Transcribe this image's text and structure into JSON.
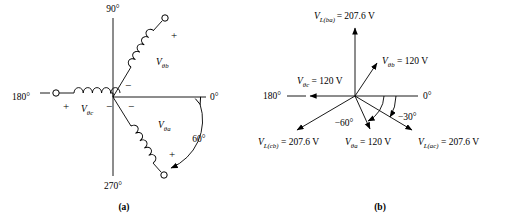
{
  "figure": {
    "panels": [
      {
        "caption": "(a)",
        "type": "source-winding-diagram",
        "axis_labels": {
          "top": "90°",
          "right": "0°",
          "bottom": "270°",
          "left": "180°"
        },
        "windings": [
          {
            "name": "phase-b-winding",
            "label_main": "V",
            "label_sub": "θb",
            "polarity_near_origin": "−",
            "polarity_far": "+",
            "orientation": "upper-right-60deg"
          },
          {
            "name": "phase-c-winding",
            "label_main": "V",
            "label_sub": "θc",
            "polarity_near_origin": "−",
            "polarity_far": "+",
            "orientation": "left-180deg"
          },
          {
            "name": "phase-a-winding",
            "label_main": "V",
            "label_sub": "θa",
            "polarity_near_origin": "−",
            "polarity_far": "+",
            "orientation": "lower-right-minus60deg"
          }
        ],
        "arc_annotation": "60°"
      },
      {
        "caption": "(b)",
        "type": "phasor-diagram",
        "axis_labels": {
          "right": "0°",
          "left": "180°"
        },
        "angle_annotations": [
          "−30°",
          "−60°"
        ],
        "phasors": [
          {
            "name": "V-L-ba",
            "symbol": "V",
            "subscript": "L(ba)",
            "value": "207.6 V",
            "equals": "=",
            "angle_deg": 90,
            "magnitude": 207.6,
            "text": "V_L(ba) = 207.6 V"
          },
          {
            "name": "V-theta-b",
            "symbol": "V",
            "subscript": "θb",
            "value": "120 V",
            "equals": "=",
            "angle_deg": 60,
            "magnitude": 120,
            "text": "V_θb = 120 V"
          },
          {
            "name": "V-theta-c",
            "symbol": "V",
            "subscript": "θc",
            "value": "120 V",
            "equals": "=",
            "angle_deg": 180,
            "magnitude": 120,
            "text": "V_θc = 120 V"
          },
          {
            "name": "V-L-cb",
            "symbol": "V",
            "subscript": "L(cb)",
            "value": "207.6 V",
            "equals": "=",
            "angle_deg": -150,
            "magnitude": 207.6,
            "text": "V_L(cb) = 207.6 V"
          },
          {
            "name": "V-theta-a",
            "symbol": "V",
            "subscript": "θa",
            "value": "120 V",
            "equals": "=",
            "angle_deg": -60,
            "magnitude": 120,
            "text": "V_θa = 120 V"
          },
          {
            "name": "V-L-ac",
            "symbol": "V",
            "subscript": "L(ac)",
            "value": "207.6 V",
            "equals": "=",
            "angle_deg": -30,
            "magnitude": 207.6,
            "text": "V_L(ac) = 207.6 V"
          }
        ]
      }
    ]
  },
  "colors": {
    "ink": "#000000",
    "background": "#ffffff"
  }
}
